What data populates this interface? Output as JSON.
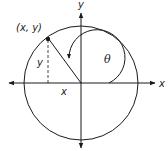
{
  "diagram": {
    "labels": {
      "x_axis": "x",
      "y_axis": "y",
      "point": "(x, y)",
      "y_segment": "y",
      "x_segment": "x",
      "angle": "θ"
    },
    "geometry": {
      "center": [
        81,
        83
      ],
      "radius": 57,
      "point": [
        48,
        37
      ],
      "angle_arc_radius": 28
    },
    "colors": {
      "stroke": "#1a1a1a",
      "background": "#ffffff"
    }
  }
}
